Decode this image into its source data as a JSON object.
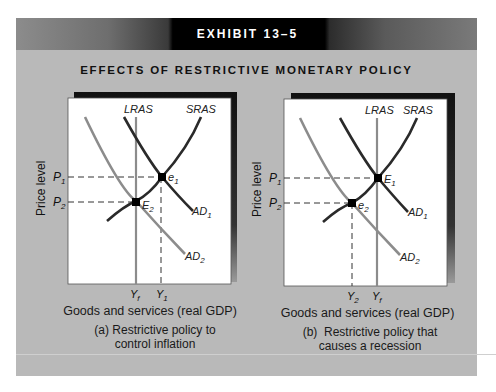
{
  "header": {
    "exhibit_label": "EXHIBIT 13–5",
    "title": "EFFECTS OF RESTRICTIVE MONETARY POLICY"
  },
  "colors": {
    "background_gray": "#b9b9b9",
    "panel_white": "#ffffff",
    "ad1_sras_dark": "#2a2a2a",
    "ad2_lras_gray": "#8c8c8c",
    "shadow_black": "#111111"
  },
  "panels": [
    {
      "id": "a",
      "y_axis_label": "Price level",
      "x_axis_label": "Goods and services (real GDP)",
      "caption_line1": "(a) Restrictive policy to",
      "caption_line2": "control inflation",
      "price_ticks": {
        "p1": "P",
        "p1_sub": "1",
        "p2": "P",
        "p2_sub": "2"
      },
      "x_ticks": [
        {
          "main": "Y",
          "sub": "f"
        },
        {
          "main": "Y",
          "sub": "1"
        }
      ],
      "curve_labels": {
        "lras": "LRAS",
        "sras": "SRAS",
        "ad1": "AD",
        "ad1_sub": "1",
        "ad2": "AD",
        "ad2_sub": "2"
      },
      "points": [
        {
          "main": "e",
          "sub": "1",
          "desc": "initial short-run equilibrium at P1, Y1"
        },
        {
          "main": "E",
          "sub": "2",
          "desc": "long-run equilibrium at P2, Yf"
        }
      ]
    },
    {
      "id": "b",
      "y_axis_label": "Price level",
      "x_axis_label": "Goods and services (real GDP)",
      "caption_line1": "(b)  Restrictive policy that",
      "caption_line2": "causes a recession",
      "price_ticks": {
        "p1": "P",
        "p1_sub": "1",
        "p2": "P",
        "p2_sub": "2"
      },
      "x_ticks": [
        {
          "main": "Y",
          "sub": "2"
        },
        {
          "main": "Y",
          "sub": "f"
        }
      ],
      "curve_labels": {
        "lras": "LRAS",
        "sras": "SRAS",
        "ad1": "AD",
        "ad1_sub": "1",
        "ad2": "AD",
        "ad2_sub": "2"
      },
      "points": [
        {
          "main": "E",
          "sub": "1",
          "desc": "initial long-run equilibrium at P1, Yf"
        },
        {
          "main": "e",
          "sub": "2",
          "desc": "recessionary equilibrium at P2, Y2"
        }
      ]
    }
  ]
}
